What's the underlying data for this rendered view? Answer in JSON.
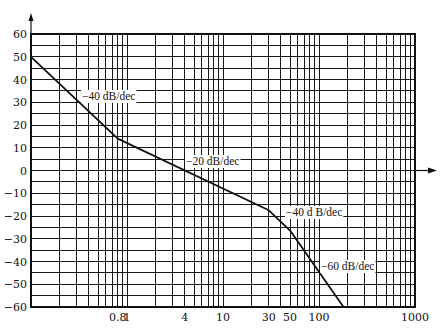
{
  "chart_data": {
    "type": "line",
    "title": "",
    "xlabel": "",
    "ylabel": "",
    "xscale": "log",
    "xlim": [
      0.1,
      1000
    ],
    "ylim": [
      -60,
      60
    ],
    "grid": true,
    "legend": null,
    "y_ticks": [
      60,
      50,
      40,
      30,
      20,
      10,
      0,
      -10,
      -20,
      -30,
      -40,
      -50,
      -60
    ],
    "y_tick_labels": [
      "60",
      "50",
      "40",
      "30",
      "20",
      "10",
      "0",
      "−10",
      "−20",
      "−30",
      "−40",
      "−50",
      "−60"
    ],
    "y_minor_gridlines_step": 5,
    "x_tick_labels": [
      {
        "value": 0.8,
        "label": "0.8"
      },
      {
        "value": 1,
        "label": "1"
      },
      {
        "value": 4,
        "label": "4"
      },
      {
        "value": 10,
        "label": "10"
      },
      {
        "value": 30,
        "label": "30"
      },
      {
        "value": 50,
        "label": "50"
      },
      {
        "value": 100,
        "label": "100"
      },
      {
        "value": 1000,
        "label": "1000"
      }
    ],
    "series": [
      {
        "name": "asymptotic magnitude",
        "x": [
          0.1,
          0.8,
          30,
          50,
          180
        ],
        "y": [
          50,
          14,
          -17.5,
          -26.4,
          -60
        ]
      }
    ],
    "annotations": [
      {
        "text": "−40 dB/dec",
        "x_px": 82,
        "y_px": 100
      },
      {
        "text": "−20 dB/dec",
        "x_px": 186,
        "y_px": 165
      },
      {
        "text": "−40 d B/dec",
        "x_px": 286,
        "y_px": 216
      },
      {
        "text": "−60 dB/dec",
        "x_px": 321,
        "y_px": 270
      }
    ]
  },
  "layout": {
    "x0_px": 31,
    "decade_px": 96,
    "y_top_px": 34,
    "px_per_db": 2.275,
    "zero_arrow_end_px": 437,
    "y_axis_arrow_top_px": 13
  }
}
